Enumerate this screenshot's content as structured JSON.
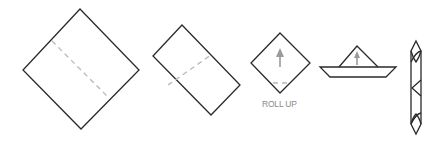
{
  "diagram": {
    "steps": [
      {
        "id": 1,
        "shape": "square-diamond",
        "fold_line": "dashed-diagonal"
      },
      {
        "id": 2,
        "shape": "rectangle-rotated",
        "fold_line": "dashed-center"
      },
      {
        "id": 3,
        "shape": "small-diamond",
        "arrow": "up-arrow",
        "fold_line": "dashed-bottom",
        "label": "ROLL UP"
      },
      {
        "id": 4,
        "shape": "boat-fold",
        "arrow": "up-arrow"
      },
      {
        "id": 5,
        "shape": "rolled-tube"
      }
    ],
    "colors": {
      "outline": "#2a2a2a",
      "fold_line": "#b8b8b8",
      "arrow": "#9a9a9a",
      "label": "#8a8a8a",
      "background": "#ffffff"
    }
  }
}
